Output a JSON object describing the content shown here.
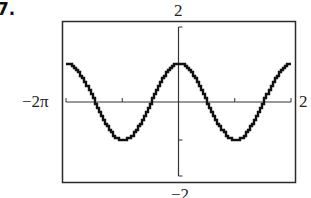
{
  "exercise_number": "7.",
  "labels": {
    "y_max": "2",
    "y_min": "−2",
    "x_min": "−2π",
    "x_max": "2"
  },
  "colors": {
    "frame": "#2a2a2a",
    "curve": "#111111",
    "axis": "#333333"
  },
  "chart_data": {
    "type": "line",
    "title": "",
    "function": "y = cos(x)",
    "xlabel": "",
    "ylabel": "",
    "xlim": [
      -6.2832,
      6.2832
    ],
    "ylim": [
      -2,
      2
    ],
    "x_tick_step": 3.1416,
    "y_tick_step": 1,
    "grid": false,
    "legend": null,
    "series": [
      {
        "name": "cos(x)",
        "x": [
          -6.2832,
          -4.7124,
          -3.1416,
          -1.5708,
          0,
          1.5708,
          3.1416,
          4.7124,
          6.2832
        ],
        "y": [
          1,
          0,
          -1,
          0,
          1,
          0,
          -1,
          0,
          1
        ]
      }
    ]
  }
}
